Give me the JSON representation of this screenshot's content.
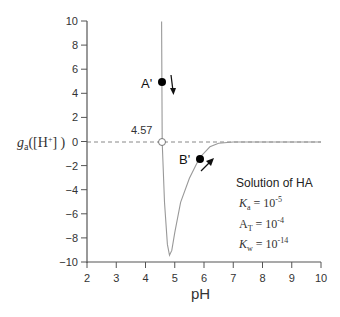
{
  "chart_data": {
    "type": "line",
    "title": "",
    "xlabel": "pH",
    "ylabel": "g_a([H+])",
    "xlim": [
      2,
      10
    ],
    "ylim": [
      -10,
      10
    ],
    "x_ticks": [
      "2",
      "3",
      "4",
      "5",
      "6",
      "7",
      "8",
      "9",
      "10"
    ],
    "y_ticks": [
      "10",
      "8",
      "6",
      "4",
      "2",
      "0",
      "−2",
      "−4",
      "−6",
      "−8",
      "−10"
    ],
    "grid": false,
    "series": [
      {
        "name": "g_a([H+])",
        "x": [
          4.55,
          4.57,
          4.65,
          4.75,
          4.82,
          4.9,
          5.0,
          5.2,
          5.5,
          5.85,
          6.2,
          6.5,
          7.0,
          8.0,
          10.0
        ],
        "y": [
          10,
          0,
          -5,
          -8.5,
          -9.4,
          -9,
          -7.5,
          -5,
          -3,
          -1.3,
          -0.4,
          -0.1,
          0,
          0,
          0
        ]
      }
    ],
    "annotations": [
      {
        "label": "A'",
        "x": 4.57,
        "y": 5,
        "arrow": "down"
      },
      {
        "label": "B'",
        "x": 5.85,
        "y": -1.4,
        "arrow": "up-right"
      },
      {
        "label": "4.57",
        "x": 4.57,
        "y": 0,
        "marker": "open-circle"
      }
    ],
    "reference_line": {
      "y": 0,
      "style": "dashed"
    },
    "legend_box": {
      "title": "Solution of HA",
      "lines": [
        {
          "sym": "K",
          "sub": "a",
          "eq": " = 10",
          "sup": "-5"
        },
        {
          "sym": "A",
          "sub": "T",
          "eq": " = 10",
          "sup": "-4"
        },
        {
          "sym": "K",
          "sub": "w",
          "eq": " = 10",
          "sup": "-14"
        }
      ]
    }
  }
}
